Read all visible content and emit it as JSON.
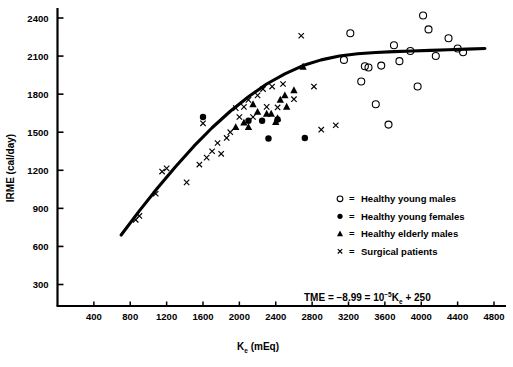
{
  "chart_data": {
    "type": "scatter",
    "title": "",
    "xlabel": "K_e (mEq)",
    "ylabel": "IRME (cal/day)",
    "xlabel_main": "K",
    "xlabel_sub": "e",
    "xlabel_unit": " (mEq)",
    "xlim": [
      0,
      4800
    ],
    "ylim": [
      0,
      2500
    ],
    "xticks": [
      400,
      800,
      1200,
      1600,
      2000,
      2400,
      2800,
      3200,
      3600,
      4000,
      4400,
      4800
    ],
    "yticks": [
      300,
      600,
      900,
      1200,
      1500,
      1800,
      2100,
      2400
    ],
    "grid": false,
    "legend_position": "inside-lower-right",
    "annotation": "TME = -8.99 = 10^-5 K_e + 250",
    "annotation_parts": {
      "lead": "TME  =  −8.99  =  10",
      "exp": "−5",
      "var": "K",
      "var_sub": "e",
      "tail": "  +  250"
    },
    "fit_curve": {
      "name": "Fitted regression curve",
      "description": "Monotonic saturating curve rising steeply then plateauing near 2100 cal/day",
      "points": [
        [
          700,
          690
        ],
        [
          900,
          880
        ],
        [
          1100,
          1060
        ],
        [
          1300,
          1230
        ],
        [
          1500,
          1390
        ],
        [
          1700,
          1535
        ],
        [
          1900,
          1665
        ],
        [
          2100,
          1780
        ],
        [
          2300,
          1880
        ],
        [
          2500,
          1960
        ],
        [
          2700,
          2025
        ],
        [
          2900,
          2070
        ],
        [
          3100,
          2100
        ],
        [
          3300,
          2118
        ],
        [
          3500,
          2128
        ],
        [
          3700,
          2135
        ],
        [
          3900,
          2140
        ],
        [
          4100,
          2145
        ],
        [
          4300,
          2150
        ],
        [
          4500,
          2155
        ],
        [
          4700,
          2160
        ]
      ]
    },
    "series": [
      {
        "name": "Healthy young males",
        "marker": "open-circle",
        "color": "#000000",
        "points": [
          [
            3150,
            2070
          ],
          [
            3220,
            2280
          ],
          [
            3340,
            1900
          ],
          [
            3380,
            2020
          ],
          [
            3420,
            2010
          ],
          [
            3500,
            1720
          ],
          [
            3560,
            2025
          ],
          [
            3640,
            1560
          ],
          [
            3700,
            2185
          ],
          [
            3760,
            2060
          ],
          [
            3880,
            2140
          ],
          [
            3960,
            1860
          ],
          [
            4020,
            2420
          ],
          [
            4080,
            2310
          ],
          [
            4160,
            2100
          ],
          [
            4300,
            2240
          ],
          [
            4400,
            2160
          ],
          [
            4460,
            2130
          ]
        ]
      },
      {
        "name": "Healthy young females",
        "marker": "filled-circle",
        "color": "#000000",
        "points": [
          [
            1600,
            1620
          ],
          [
            2100,
            1590
          ],
          [
            2250,
            1590
          ],
          [
            2420,
            1600
          ],
          [
            2320,
            1450
          ],
          [
            2720,
            1455
          ]
        ]
      },
      {
        "name": "Healthy elderly males",
        "marker": "filled-triangle",
        "color": "#000000",
        "points": [
          [
            2050,
            1575
          ],
          [
            2100,
            1540
          ],
          [
            2150,
            1720
          ],
          [
            2200,
            1660
          ],
          [
            2300,
            1645
          ],
          [
            2350,
            1645
          ],
          [
            2400,
            1580
          ],
          [
            2420,
            1610
          ],
          [
            2450,
            1755
          ],
          [
            2500,
            1790
          ],
          [
            2520,
            1700
          ],
          [
            2600,
            1830
          ],
          [
            2700,
            2015
          ],
          [
            1960,
            1540
          ]
        ]
      },
      {
        "name": "Surgical patients",
        "marker": "cross",
        "color": "#000000",
        "points": [
          [
            860,
            810
          ],
          [
            900,
            840
          ],
          [
            1080,
            1015
          ],
          [
            1150,
            1190
          ],
          [
            1200,
            1215
          ],
          [
            1560,
            1245
          ],
          [
            1600,
            1570
          ],
          [
            1640,
            1300
          ],
          [
            1700,
            1350
          ],
          [
            1760,
            1415
          ],
          [
            1800,
            1330
          ],
          [
            1860,
            1455
          ],
          [
            1900,
            1500
          ],
          [
            1960,
            1690
          ],
          [
            2000,
            1620
          ],
          [
            2050,
            1700
          ],
          [
            2100,
            1755
          ],
          [
            2150,
            1620
          ],
          [
            2200,
            1790
          ],
          [
            2260,
            1840
          ],
          [
            2300,
            1700
          ],
          [
            2360,
            1860
          ],
          [
            2420,
            1695
          ],
          [
            2480,
            1880
          ],
          [
            2600,
            1760
          ],
          [
            2820,
            1860
          ],
          [
            2900,
            1520
          ],
          [
            3060,
            1555
          ],
          [
            2680,
            2260
          ],
          [
            1420,
            1105
          ]
        ]
      }
    ]
  },
  "legend": {
    "items": [
      {
        "marker": "open-circle",
        "eq": "=",
        "label": "Healthy young males"
      },
      {
        "marker": "filled-circle",
        "eq": "=",
        "label": "Healthy young females"
      },
      {
        "marker": "filled-triangle",
        "eq": "=",
        "label": "Healthy elderly males"
      },
      {
        "marker": "cross",
        "eq": "=",
        "label": "Surgical patients"
      }
    ]
  }
}
